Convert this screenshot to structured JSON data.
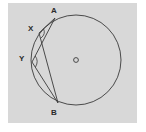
{
  "diagram": {
    "type": "geometry-circle-inscribed-angles",
    "colors": {
      "background": "#d8d8d8",
      "stroke": "#3a3a3a",
      "text": "#2a2a2a"
    },
    "circle": {
      "center_label": "O",
      "cx": 76,
      "cy": 60,
      "r": 45
    },
    "points": [
      {
        "label": "A",
        "x": 55,
        "y": 18,
        "label_x": 51,
        "label_y": 13
      },
      {
        "label": "X",
        "x": 39,
        "y": 33,
        "label_x": 28,
        "label_y": 31
      },
      {
        "label": "Y",
        "x": 32,
        "y": 62,
        "label_x": 19,
        "label_y": 61
      },
      {
        "label": "B",
        "x": 58,
        "y": 103,
        "label_x": 51,
        "label_y": 115
      }
    ],
    "segments": [
      [
        "A",
        "X"
      ],
      [
        "X",
        "B"
      ],
      [
        "A",
        "Y"
      ],
      [
        "Y",
        "B"
      ]
    ],
    "angle_marks": [
      "X",
      "Y"
    ]
  }
}
